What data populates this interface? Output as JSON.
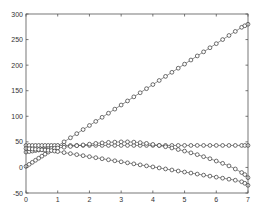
{
  "chart_data": {
    "type": "line",
    "title": "",
    "xlabel": "",
    "ylabel": "",
    "xlim": [
      0,
      7
    ],
    "ylim": [
      -50,
      300
    ],
    "xticks": [
      0,
      1,
      2,
      3,
      4,
      5,
      6,
      7
    ],
    "yticks": [
      -50,
      0,
      50,
      100,
      150,
      200,
      250,
      300
    ],
    "grid": false,
    "legend": null,
    "marker": "circle",
    "x": [
      0,
      0.1,
      0.2,
      0.3,
      0.4,
      0.5,
      0.6,
      0.7,
      0.8,
      0.9,
      1.0,
      1.2,
      1.4,
      1.6,
      1.8,
      2.0,
      2.2,
      2.4,
      2.6,
      2.8,
      3.0,
      3.2,
      3.4,
      3.6,
      3.8,
      4.0,
      4.2,
      4.4,
      4.6,
      4.8,
      5.0,
      5.2,
      5.4,
      5.6,
      5.8,
      6.0,
      6.2,
      6.4,
      6.6,
      6.8,
      6.9,
      7.0
    ],
    "series": [
      {
        "name": "rising",
        "values": [
          2,
          6,
          10,
          14,
          18,
          22,
          26,
          30,
          34,
          38,
          42,
          50,
          58,
          66,
          74,
          82,
          90,
          98,
          106,
          114,
          122,
          130,
          138,
          146,
          154,
          162,
          170,
          178,
          186,
          194,
          202,
          210,
          218,
          226,
          234,
          242,
          250,
          258,
          266,
          274,
          277,
          280
        ]
      },
      {
        "name": "constant",
        "values": [
          43,
          43,
          43,
          43,
          43,
          43,
          43,
          43,
          43,
          43,
          43,
          43,
          43,
          43,
          43,
          43,
          43,
          43,
          43,
          43,
          43,
          43,
          43,
          43,
          43,
          43,
          43,
          43,
          43,
          43,
          43,
          43,
          43,
          43,
          43,
          43,
          43,
          43,
          43,
          43,
          43,
          43
        ]
      },
      {
        "name": "hump",
        "values": [
          30,
          31,
          32,
          33,
          34,
          35,
          36,
          36.5,
          37,
          37.5,
          38,
          39.5,
          41,
          42.5,
          44,
          45.5,
          47,
          48,
          49,
          49.5,
          50,
          50,
          49.5,
          48.5,
          47,
          45,
          43,
          40.5,
          38,
          35,
          32,
          28.5,
          25,
          21,
          17,
          12.5,
          8,
          3,
          -3,
          -10,
          -14,
          -20
        ]
      },
      {
        "name": "descending",
        "values": [
          37,
          36.5,
          36,
          35.5,
          35,
          34.5,
          34,
          33.5,
          33,
          32,
          31,
          29,
          27,
          25,
          23,
          21,
          19,
          17,
          15,
          13,
          11,
          9,
          7,
          5,
          3,
          1,
          -1,
          -3,
          -5,
          -7,
          -9,
          -11,
          -13,
          -15,
          -17,
          -19,
          -21,
          -23,
          -25,
          -28,
          -31,
          -35
        ]
      }
    ]
  },
  "plot_area": {
    "left_px": 26,
    "right_px": 248,
    "top_px": 14,
    "bottom_px": 193
  }
}
